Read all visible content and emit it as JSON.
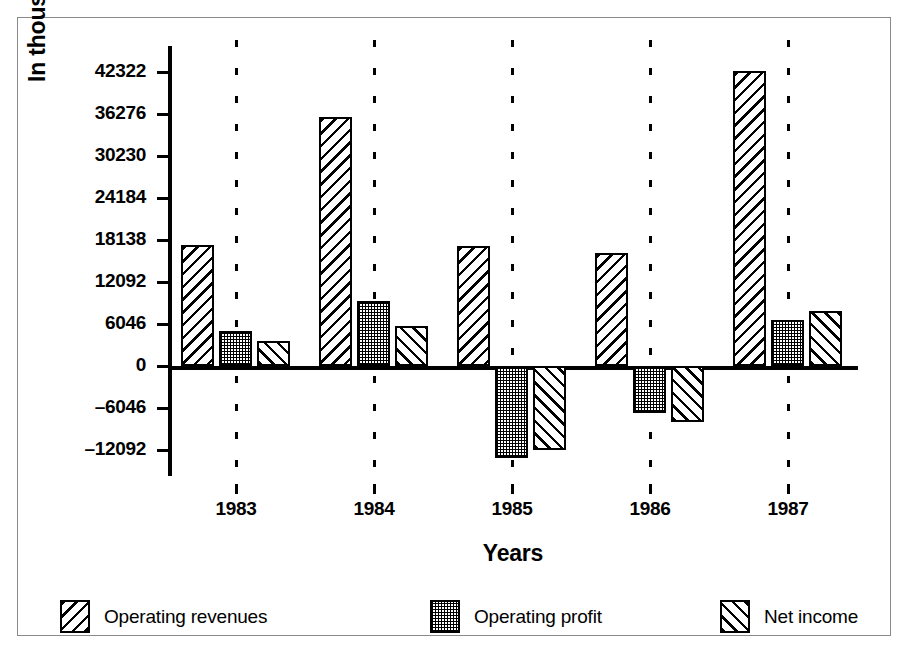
{
  "chart": {
    "type": "bar",
    "ylabel": "In thousands of dollars",
    "xlabel": "Years"
  },
  "chart_data": {
    "type": "bar",
    "title": "",
    "subtitle": "",
    "xlabel": "Years",
    "ylabel": "In thousands of dollars",
    "categories": [
      "1983",
      "1984",
      "1985",
      "1986",
      "1987"
    ],
    "series": [
      {
        "name": "Operating revenues",
        "values": [
          17400,
          35840,
          17270,
          16270,
          42470
        ],
        "pattern": "backslash-hatch"
      },
      {
        "name": "Operating profit",
        "values": [
          5040,
          9360,
          -13240,
          -6770,
          6620
        ],
        "pattern": "dot-stipple"
      },
      {
        "name": "Net income",
        "values": [
          3600,
          5760,
          -12100,
          -8060,
          7920
        ],
        "pattern": "forwardslash-hatch"
      }
    ],
    "ylim": [
      -12092,
      42322
    ],
    "ytick_values": [
      42322,
      36276,
      30230,
      24184,
      18138,
      12092,
      6046,
      0,
      -6046,
      -12092
    ],
    "ytick_labels": [
      "42322",
      "36276",
      "30230",
      "24184",
      "18138",
      "12092",
      "6046",
      "0",
      "–6046",
      "–12092"
    ],
    "grid": false,
    "group_dividers": true,
    "legend_position": "bottom",
    "zero_line": true
  },
  "legend": {
    "items": [
      {
        "label": "Operating revenues"
      },
      {
        "label": "Operating profit"
      },
      {
        "label": "Net income"
      }
    ]
  }
}
